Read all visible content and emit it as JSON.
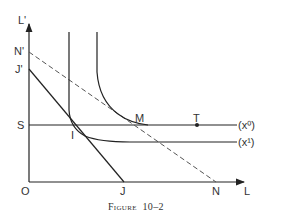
{
  "figure": {
    "caption_prefix": "Figure",
    "caption_number": "10–2"
  },
  "axes": {
    "y_label": "L'",
    "x_label": "L",
    "origin_label": "O"
  },
  "points": {
    "N_prime": "N'",
    "J_prime": "J'",
    "S": "S",
    "I": "I",
    "M": "M",
    "T": "T",
    "J": "J",
    "N": "N"
  },
  "curves": {
    "x0_label": "(x⁰)",
    "x1_label": "(x¹)"
  },
  "colors": {
    "line": "#222222",
    "dashed": "#555555",
    "text": "#333333",
    "background": "#ffffff"
  }
}
